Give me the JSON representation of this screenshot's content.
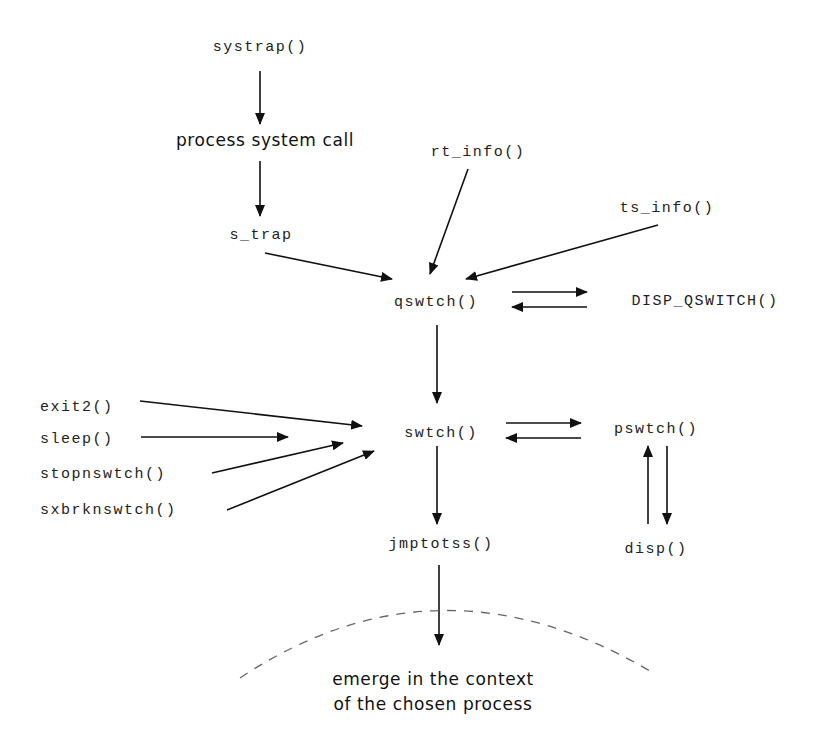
{
  "diagram": {
    "nodes": {
      "systrap": "systrap()",
      "process_syscall": "process system call",
      "s_trap": "s_trap",
      "rt_info": "rt_info()",
      "ts_info": "ts_info()",
      "qswtch": "qswtch()",
      "disp_qswitch": "DISP_QSWITCH()",
      "exit2": "exit2()",
      "sleep": "sleep()",
      "stopnswtch": "stopnswtch()",
      "sxbrknswtch": "sxbrknswtch()",
      "swtch": "swtch()",
      "pswtch": "pswtch()",
      "jmptotss": "jmptotss()",
      "disp": "disp()",
      "emerge_line1": "emerge in the context",
      "emerge_line2": "of the chosen process"
    },
    "edges": [
      [
        "systrap",
        "process_syscall"
      ],
      [
        "process_syscall",
        "s_trap"
      ],
      [
        "s_trap",
        "qswtch"
      ],
      [
        "rt_info",
        "qswtch"
      ],
      [
        "ts_info",
        "qswtch"
      ],
      [
        "qswtch",
        "disp_qswitch"
      ],
      [
        "disp_qswitch",
        "qswtch"
      ],
      [
        "qswtch",
        "swtch"
      ],
      [
        "exit2",
        "swtch"
      ],
      [
        "sleep",
        "swtch"
      ],
      [
        "stopnswtch",
        "swtch"
      ],
      [
        "sxbrknswtch",
        "swtch"
      ],
      [
        "swtch",
        "pswtch"
      ],
      [
        "pswtch",
        "swtch"
      ],
      [
        "pswtch",
        "disp"
      ],
      [
        "disp",
        "pswtch"
      ],
      [
        "swtch",
        "jmptotss"
      ],
      [
        "jmptotss",
        "emerge"
      ]
    ]
  }
}
